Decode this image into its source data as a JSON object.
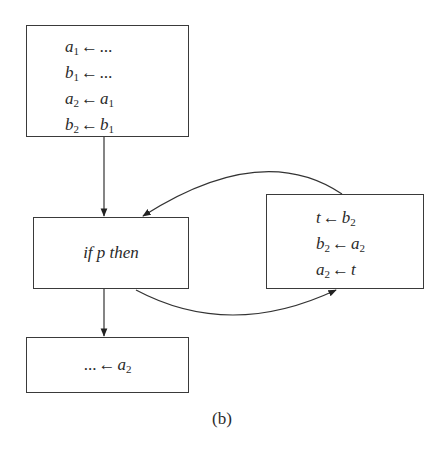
{
  "diagram": {
    "caption": "(b)",
    "nodes": [
      {
        "id": "init",
        "lines": [
          {
            "lhs": "a",
            "lhs_sub": "1",
            "rhs": "...",
            "rhs_sub": ""
          },
          {
            "lhs": "b",
            "lhs_sub": "1",
            "rhs": "...",
            "rhs_sub": ""
          },
          {
            "lhs": "a",
            "lhs_sub": "2",
            "rhs": "a",
            "rhs_sub": "1"
          },
          {
            "lhs": "b",
            "lhs_sub": "2",
            "rhs": "b",
            "rhs_sub": "1"
          }
        ]
      },
      {
        "id": "cond",
        "text": "if p then"
      },
      {
        "id": "swap",
        "lines": [
          {
            "lhs": "t",
            "lhs_sub": "",
            "rhs": "b",
            "rhs_sub": "2"
          },
          {
            "lhs": "b",
            "lhs_sub": "2",
            "rhs": "a",
            "rhs_sub": "2"
          },
          {
            "lhs": "a",
            "lhs_sub": "2",
            "rhs": "t",
            "rhs_sub": ""
          }
        ]
      },
      {
        "id": "use",
        "lines": [
          {
            "lhs": "...",
            "lhs_sub": "",
            "rhs": "a",
            "rhs_sub": "2"
          }
        ]
      }
    ],
    "assign_symbol": "←",
    "edges": [
      {
        "from": "init",
        "to": "cond"
      },
      {
        "from": "cond",
        "to": "swap"
      },
      {
        "from": "swap",
        "to": "cond"
      },
      {
        "from": "cond",
        "to": "use"
      }
    ]
  }
}
